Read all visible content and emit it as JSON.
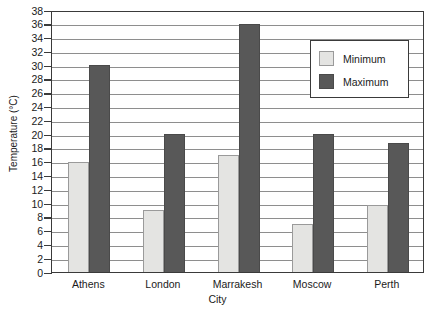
{
  "chart_data": {
    "type": "bar",
    "title": "",
    "subtitle": "",
    "xlabel": "City",
    "ylabel": "Temperature (°C)",
    "categories": [
      "Athens",
      "London",
      "Marrakesh",
      "Moscow",
      "Perth"
    ],
    "series": [
      {
        "name": "Minimum",
        "color": "#e4e4e2",
        "values": [
          16,
          9,
          17,
          7,
          9.7
        ]
      },
      {
        "name": "Maximum",
        "color": "#585858",
        "values": [
          30,
          20,
          36,
          20,
          18.7
        ]
      }
    ],
    "ylim": [
      0,
      38
    ],
    "ytick_step": 2,
    "yticks": [
      0,
      2,
      4,
      6,
      8,
      10,
      12,
      14,
      16,
      18,
      20,
      22,
      24,
      26,
      28,
      30,
      32,
      34,
      36,
      38
    ],
    "ytick_labels": [
      "0",
      "2",
      "4",
      "6",
      "8",
      "10",
      "12",
      "14",
      "16",
      "18",
      "20",
      "22",
      "24",
      "26",
      "28",
      "30",
      "32",
      "34",
      "36",
      "38"
    ],
    "grid": true,
    "grid_axis": "y",
    "legend": {
      "position": "top-right",
      "entries": [
        "Minimum",
        "Maximum"
      ]
    }
  }
}
